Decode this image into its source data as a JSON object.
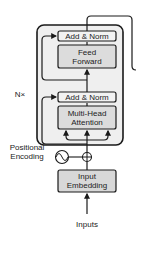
{
  "diagram": {
    "repeat_label": "N×",
    "blocks": {
      "add_norm_top": "Add & Norm",
      "feed_forward": "Feed Forward",
      "add_norm_bottom": "Add & Norm",
      "multi_head_attention": "Multi-Head Attention",
      "input_embedding": "Input Embedding"
    },
    "positional_encoding": "Positional Encoding",
    "inputs": "Inputs",
    "colors": {
      "outer_block": "#efefef",
      "add_norm": "#f2f2f2",
      "sublayer_box": "#dcdcdc",
      "embedding_box": "#d8d8d8",
      "stroke": "#1a1a1a"
    }
  }
}
